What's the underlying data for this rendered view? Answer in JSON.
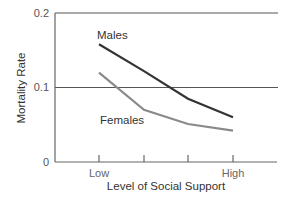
{
  "chart_data": {
    "type": "line",
    "title": "",
    "xlabel": "Level of Social Support",
    "ylabel": "Mortality Rate",
    "categories": [
      "Low",
      "",
      "",
      "High"
    ],
    "x_tick_labels": [
      "Low",
      "High"
    ],
    "y_ticks": [
      0,
      0.1,
      0.2
    ],
    "y_tick_labels": [
      "0",
      "0.1",
      "0.2"
    ],
    "ylim": [
      0,
      0.2
    ],
    "grid": "horizontal at 0.1 and 0.2",
    "legend": "inline labels",
    "series": [
      {
        "name": "Males",
        "values": [
          0.158,
          0.122,
          0.085,
          0.06
        ],
        "color": "#333333"
      },
      {
        "name": "Females",
        "values": [
          0.12,
          0.07,
          0.051,
          0.042
        ],
        "color": "#8a8a8a"
      }
    ]
  }
}
